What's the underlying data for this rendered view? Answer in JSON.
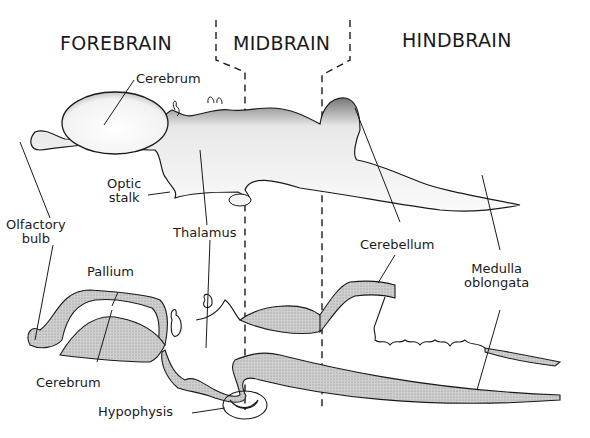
{
  "diagram": {
    "regions": [
      {
        "id": "forebrain",
        "label": "FOREBRAIN"
      },
      {
        "id": "midbrain",
        "label": "MIDBRAIN"
      },
      {
        "id": "hindbrain",
        "label": "HINDBRAIN"
      }
    ],
    "external_view_labels": {
      "cerebrum": "Cerebrum",
      "optic_stalk": "Optic\nstalk",
      "olfactory_bulb": "Olfactory\nbulb",
      "thalamus": "Thalamus",
      "cerebellum": "Cerebellum",
      "medulla_oblongata": "Medulla\noblongata"
    },
    "section_view_labels": {
      "pallium": "Pallium",
      "cerebrum": "Cerebrum",
      "hypophysis": "Hypophysis"
    },
    "colors": {
      "ink": "#1a1a1a",
      "section_fill": "#c8c8c8",
      "stipple": "#555555",
      "background": "#ffffff"
    }
  }
}
